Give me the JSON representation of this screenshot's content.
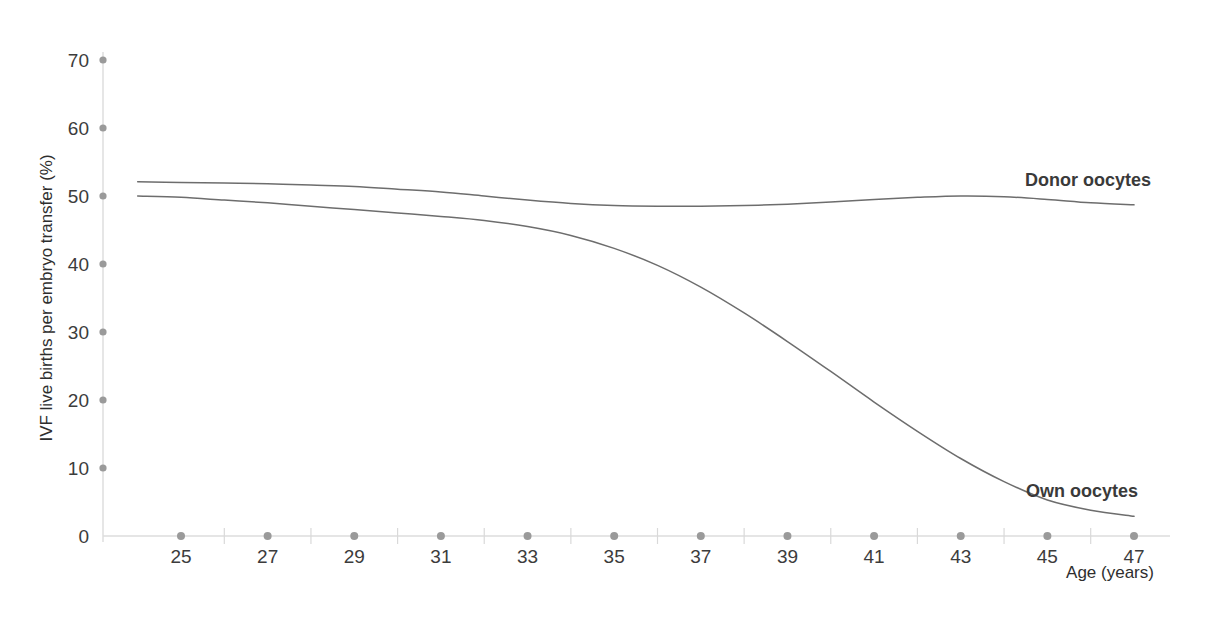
{
  "chart_data": {
    "type": "line",
    "title": "",
    "xlabel": "Age (years)",
    "ylabel": "IVF live births per embryo transfer (%)",
    "xlim": [
      23.5,
      47.7
    ],
    "ylim": [
      0,
      70
    ],
    "grid": false,
    "legend_position": "inline-right-of-curves",
    "x_ticks": [
      25,
      27,
      29,
      31,
      33,
      35,
      37,
      39,
      41,
      43,
      45,
      47
    ],
    "x_minor_ticks": [
      26,
      28,
      30,
      32,
      34,
      36,
      38,
      40,
      42,
      44,
      46
    ],
    "y_ticks": [
      0,
      10,
      20,
      30,
      40,
      50,
      60,
      70
    ],
    "x": [
      24,
      25,
      26,
      27,
      28,
      29,
      30,
      31,
      32,
      33,
      34,
      35,
      36,
      37,
      38,
      39,
      40,
      41,
      42,
      43,
      44,
      45,
      46,
      47
    ],
    "series": [
      {
        "name": "Donor oocytes",
        "label": "Donor oocytes",
        "color": "#6d6d6d",
        "values": [
          52.1,
          52.0,
          51.9,
          51.8,
          51.6,
          51.4,
          51.0,
          50.6,
          50.0,
          49.4,
          48.9,
          48.6,
          48.5,
          48.5,
          48.6,
          48.8,
          49.1,
          49.5,
          49.8,
          50.0,
          49.9,
          49.5,
          49.0,
          48.7
        ]
      },
      {
        "name": "Own oocytes",
        "label": "Own oocytes",
        "color": "#6d6d6d",
        "values": [
          50.0,
          49.8,
          49.4,
          49.0,
          48.5,
          48.0,
          47.5,
          47.0,
          46.4,
          45.5,
          44.2,
          42.3,
          39.8,
          36.6,
          32.8,
          28.6,
          24.2,
          19.7,
          15.4,
          11.4,
          8.0,
          5.3,
          3.8,
          2.9
        ]
      }
    ],
    "series_label_positions": [
      {
        "name": "Donor oocytes",
        "x": 1025,
        "y": 186
      },
      {
        "name": "Own oocytes",
        "x": 1026,
        "y": 497
      }
    ]
  }
}
